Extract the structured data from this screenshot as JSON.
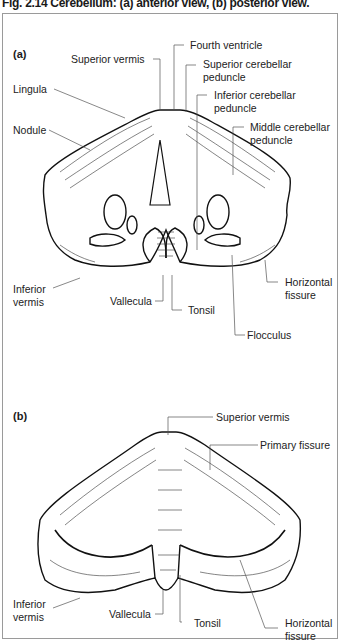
{
  "figure": {
    "title": "Fig. 2.14 Cerebellum: (a) anterior view, (b) posterior view."
  },
  "panels": [
    {
      "id": "a",
      "label": "(a)",
      "view": "anterior view",
      "annotations": [
        {
          "text": "Superior vermis"
        },
        {
          "text": "Fourth ventricle"
        },
        {
          "text": "Superior cerebellar\npeduncle",
          "line1": "Superior cerebellar",
          "line2": "peduncle"
        },
        {
          "text": "Lingula"
        },
        {
          "text": "Inferior cerebellar\npeduncle",
          "line1": "Inferior cerebellar",
          "line2": "peduncle"
        },
        {
          "text": "Nodule"
        },
        {
          "text": "Middle cerebellar\npeduncle",
          "line1": "Middle cerebellar",
          "line2": "peduncle"
        },
        {
          "text": "Inferior\nvermis",
          "line1": "Inferior",
          "line2": "vermis"
        },
        {
          "text": "Vallecula"
        },
        {
          "text": "Tonsil"
        },
        {
          "text": "Horizontal\nfissure",
          "line1": "Horizontal",
          "line2": "fissure"
        },
        {
          "text": "Flocculus"
        }
      ]
    },
    {
      "id": "b",
      "label": "(b)",
      "view": "posterior view",
      "annotations": [
        {
          "text": "Superior vermis"
        },
        {
          "text": "Primary fissure"
        },
        {
          "text": "Inferior\nvermis",
          "line1": "Inferior",
          "line2": "vermis"
        },
        {
          "text": "Vallecula"
        },
        {
          "text": "Tonsil"
        },
        {
          "text": "Horizontal\nfissure",
          "line1": "Horizontal",
          "line2": "fissure"
        }
      ]
    }
  ]
}
